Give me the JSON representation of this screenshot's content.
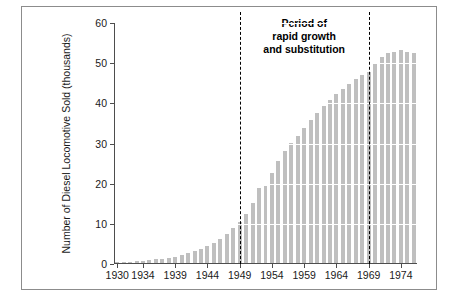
{
  "chart_data": {
    "type": "bar",
    "title": "",
    "subtitle": "",
    "xlabel": "",
    "ylabel": "Number of Diesel Locomotive Sold (thousands)",
    "xlim": [
      1929.5,
      1976.5
    ],
    "ylim": [
      0,
      60
    ],
    "grid": "horizontal-white-over-bars",
    "legend": "none",
    "bar_color": "#bfbfbf",
    "x": [
      1930,
      1931,
      1932,
      1933,
      1934,
      1935,
      1936,
      1937,
      1938,
      1939,
      1940,
      1941,
      1942,
      1943,
      1944,
      1945,
      1946,
      1947,
      1948,
      1949,
      1950,
      1951,
      1952,
      1953,
      1954,
      1955,
      1956,
      1957,
      1958,
      1959,
      1960,
      1961,
      1962,
      1963,
      1964,
      1965,
      1966,
      1967,
      1968,
      1969,
      1970,
      1971,
      1972,
      1973,
      1974,
      1975,
      1976
    ],
    "values": [
      0.2,
      0.3,
      0.3,
      0.4,
      0.5,
      0.7,
      0.9,
      1.0,
      1.2,
      1.5,
      1.9,
      2.4,
      3.0,
      3.6,
      4.3,
      5.1,
      6.0,
      7.2,
      8.6,
      10.3,
      12.1,
      15.0,
      18.7,
      19.2,
      22.3,
      25.4,
      27.8,
      29.9,
      31.7,
      33.6,
      35.5,
      37.4,
      39.0,
      40.6,
      42.0,
      43.4,
      44.6,
      45.7,
      46.7,
      47.6,
      49.6,
      51.4,
      52.2,
      52.6,
      53.0,
      52.6,
      52.3
    ],
    "y_ticks": [
      0,
      10,
      20,
      30,
      40,
      50,
      60
    ],
    "y_tick_labels": [
      "0",
      "10",
      "20",
      "30",
      "40",
      "50",
      "60"
    ],
    "x_ticks": [
      1930,
      1934,
      1939,
      1944,
      1949,
      1954,
      1959,
      1964,
      1969,
      1974
    ],
    "x_tick_labels": [
      "1930",
      "1934",
      "1939",
      "1944",
      "1949",
      "1954",
      "1959",
      "1964",
      "1969",
      "1974"
    ],
    "annotations": [
      {
        "name": "period-annotation",
        "text": "Period of\nrapid growth\nand substitution",
        "bold": true,
        "x_center": 1959
      }
    ],
    "vertical_lines": [
      {
        "name": "rapid-growth-start",
        "x": 1949,
        "style": "dashed",
        "color": "#000000"
      },
      {
        "name": "rapid-growth-end",
        "x": 1969,
        "style": "dashed",
        "color": "#000000"
      }
    ]
  }
}
